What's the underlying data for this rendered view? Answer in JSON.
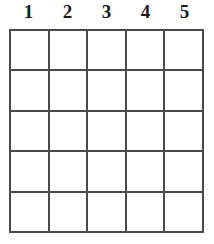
{
  "puzzle": {
    "type": "empty-grid",
    "rows": 5,
    "columns": 5,
    "background_color": "#ffffff",
    "line_color": "#4a4a4a",
    "text_color": "#1a1a1a",
    "column_headers": [
      "1",
      "2",
      "3",
      "4",
      "5"
    ],
    "cells": [
      [
        "",
        "",
        "",
        "",
        ""
      ],
      [
        "",
        "",
        "",
        "",
        ""
      ],
      [
        "",
        "",
        "",
        "",
        ""
      ],
      [
        "",
        "",
        "",
        "",
        ""
      ],
      [
        "",
        "",
        "",
        "",
        ""
      ]
    ]
  }
}
